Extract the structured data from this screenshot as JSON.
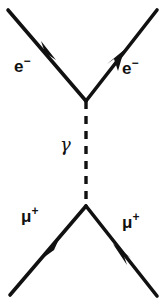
{
  "diagram": {
    "type": "feynman-diagram",
    "background_color": "#ffffff",
    "line_color": "#111111",
    "canvas": {
      "width": 166,
      "height": 306
    },
    "vertices": [
      {
        "name": "upper-vertex",
        "x": 86,
        "y": 101
      },
      {
        "name": "lower-vertex",
        "x": 86,
        "y": 206
      }
    ],
    "lines": [
      {
        "name": "incoming-electron",
        "style": "solid",
        "from": {
          "x": 8,
          "y": 10
        },
        "to": {
          "x": 86,
          "y": 101
        },
        "arrow_at": {
          "x": 50,
          "y": 53
        },
        "arrow_direction": "down-right"
      },
      {
        "name": "outgoing-electron",
        "style": "solid",
        "from": {
          "x": 86,
          "y": 101
        },
        "to": {
          "x": 157,
          "y": 10
        },
        "arrow_at": {
          "x": 118,
          "y": 59
        },
        "arrow_direction": "up-right"
      },
      {
        "name": "photon-propagator",
        "style": "dashed",
        "from": {
          "x": 86,
          "y": 101
        },
        "to": {
          "x": 86,
          "y": 206
        },
        "arrow_at": null,
        "arrow_direction": null
      },
      {
        "name": "outgoing-muon-left",
        "style": "solid",
        "from": {
          "x": 86,
          "y": 206
        },
        "to": {
          "x": 10,
          "y": 295
        },
        "arrow_at": {
          "x": 50,
          "y": 250
        },
        "arrow_direction": "down-left"
      },
      {
        "name": "incoming-muon-right",
        "style": "solid",
        "from": {
          "x": 157,
          "y": 296
        },
        "to": {
          "x": 86,
          "y": 206
        },
        "arrow_at": {
          "x": 121,
          "y": 252
        },
        "arrow_direction": "up-left"
      }
    ],
    "labels": {
      "electron_in": {
        "symbol": "e",
        "charge": "−",
        "full": "e⁻"
      },
      "electron_out": {
        "symbol": "e",
        "charge": "−",
        "full": "e⁻"
      },
      "photon": {
        "symbol": "γ",
        "full": "γ"
      },
      "muon_left": {
        "symbol": "μ",
        "charge": "+",
        "full": "μ⁺"
      },
      "muon_right": {
        "symbol": "μ",
        "charge": "+",
        "full": "μ⁺"
      }
    }
  }
}
